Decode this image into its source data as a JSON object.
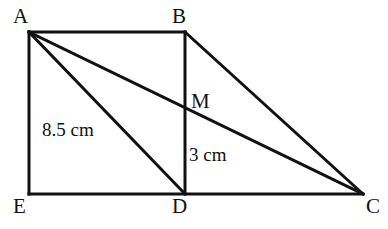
{
  "figure": {
    "background_color": "#ffffff",
    "stroke_color": "#111111",
    "stroke_width": 3,
    "vertices": {
      "A": {
        "label": "A",
        "x": 29,
        "y": 32
      },
      "B": {
        "label": "B",
        "x": 185,
        "y": 32
      },
      "C": {
        "label": "C",
        "x": 363,
        "y": 194
      },
      "D": {
        "label": "D",
        "x": 185,
        "y": 194
      },
      "E": {
        "label": "E",
        "x": 29,
        "y": 194
      },
      "M": {
        "label": "M",
        "x": 185,
        "y": 104
      }
    },
    "segments": [
      {
        "name": "segment-AB",
        "from": "A",
        "to": "B"
      },
      {
        "name": "segment-AE",
        "from": "A",
        "to": "E"
      },
      {
        "name": "segment-EC",
        "from": "E",
        "to": "C"
      },
      {
        "name": "segment-BD",
        "from": "B",
        "to": "D"
      },
      {
        "name": "segment-BC",
        "from": "B",
        "to": "C"
      },
      {
        "name": "segment-AC",
        "from": "A",
        "to": "C"
      },
      {
        "name": "segment-AD",
        "from": "A",
        "to": "D"
      }
    ],
    "measurements": {
      "ad_length": "8.5 cm",
      "md_length": "3 cm"
    }
  }
}
